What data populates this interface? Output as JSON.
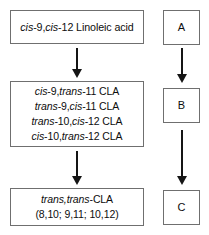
{
  "figure": {
    "type": "flowchart",
    "orientation": "vertical",
    "colors": {
      "box_border": "#6f6f6f",
      "arrow": "#151515",
      "background": "#ffffff",
      "text": "#0d0d0d"
    }
  },
  "main_flow": {
    "step1": {
      "name": "linoleic-acid",
      "line1_prefix1": "cis",
      "line1_mid": "-9,",
      "line1_prefix2": "cis",
      "line1_suffix": "-12 Linoleic acid",
      "plain_text": "cis-9,cis-12 Linoleic acid"
    },
    "step2": {
      "name": "cla-isomers",
      "lines": [
        {
          "p1": "cis",
          "m": "-9,",
          "p2": "trans",
          "s": "-11 CLA",
          "plain": "cis-9,trans-11 CLA"
        },
        {
          "p1": "trans",
          "m": "-9,",
          "p2": "cis",
          "s": "-11 CLA",
          "plain": "trans-9,cis-11 CLA"
        },
        {
          "p1": "trans",
          "m": "-10,",
          "p2": "cis",
          "s": "-12 CLA",
          "plain": "trans-10,cis-12 CLA"
        },
        {
          "p1": "cis",
          "m": "-10,",
          "p2": "trans",
          "s": "-12 CLA",
          "plain": "cis-10,trans-12 CLA"
        }
      ]
    },
    "step3": {
      "name": "trans-trans-cla",
      "line1_prefix": "trans,trans",
      "line1_suffix": "-CLA",
      "line2": "(8,10; 9,11; 10,12)",
      "plain_text": "trans,trans-CLA (8,10; 9,11; 10,12)"
    }
  },
  "tag_column": {
    "boxes": [
      {
        "label": "A"
      },
      {
        "label": "B"
      },
      {
        "label": "C"
      }
    ]
  },
  "arrows": {
    "main": [
      {
        "from": "linoleic-acid",
        "to": "cla-isomers",
        "direction": "down"
      },
      {
        "from": "cla-isomers",
        "to": "trans-trans-cla",
        "direction": "down"
      }
    ],
    "tags": [
      {
        "from": "A",
        "to": "B",
        "direction": "down"
      },
      {
        "from": "B",
        "to": "C",
        "direction": "down"
      }
    ]
  }
}
